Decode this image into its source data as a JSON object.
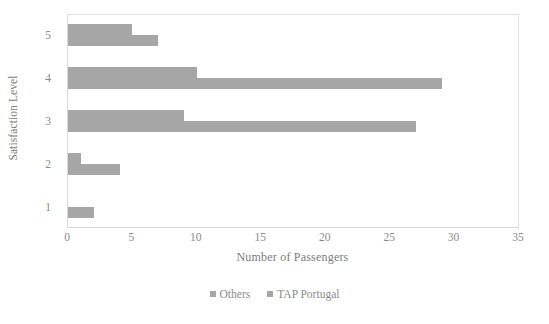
{
  "chart_data": {
    "type": "bar",
    "orientation": "horizontal",
    "title": "",
    "xlabel": "Number of Passengers",
    "ylabel": "Satisfaction Level",
    "categories": [
      "1",
      "2",
      "3",
      "4",
      "5"
    ],
    "xticks": [
      0,
      5,
      10,
      15,
      20,
      25,
      30,
      35
    ],
    "xlim": [
      0,
      35
    ],
    "grid": false,
    "legend_position": "bottom-center",
    "series": [
      {
        "name": "Others",
        "color": "#a6a6a6",
        "values": [
          0,
          1,
          9,
          10,
          5
        ]
      },
      {
        "name": "TAP Portugal",
        "color": "#a6a6a6",
        "values": [
          2,
          4,
          27,
          29,
          7
        ]
      }
    ]
  },
  "axes": {
    "y_title": "Satisfaction Level",
    "x_title": "Number of Passengers",
    "y_tick_labels": [
      "5",
      "4",
      "3",
      "2",
      "1"
    ],
    "x_tick_labels": [
      "0",
      "5",
      "10",
      "15",
      "20",
      "25",
      "30",
      "35"
    ]
  },
  "legend": {
    "items": [
      {
        "label": "Others"
      },
      {
        "label": "TAP Portugal"
      }
    ]
  },
  "colors": {
    "bar": "#a6a6a6",
    "axis_line": "#d9d9d9",
    "text": "#8a8a8a",
    "background": "#ffffff"
  }
}
